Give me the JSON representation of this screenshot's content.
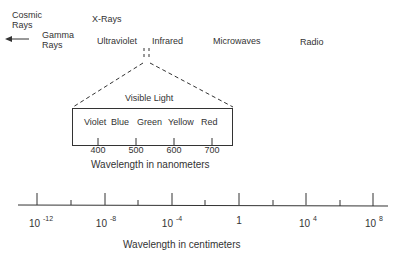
{
  "spectrum_labels": {
    "cosmic_rays_line1": "Cosmic",
    "cosmic_rays_line2": "Rays",
    "gamma_rays_line1": "Gamma",
    "gamma_rays_line2": "Rays",
    "x_rays": "X-Rays",
    "ultraviolet": "Ultraviolet",
    "infrared": "Infrared",
    "microwaves": "Microwaves",
    "radio": "Radio"
  },
  "visible_light": {
    "title": "Visible Light",
    "colors": [
      "Violet",
      "Blue",
      "Green",
      "Yellow",
      "Red"
    ],
    "ticks": [
      "400",
      "500",
      "600",
      "700"
    ],
    "axis_label": "Wavelength in nanometers"
  },
  "main_axis": {
    "ticks": [
      {
        "base": "10",
        "exp": "-12"
      },
      {
        "base": "10",
        "exp": "-8"
      },
      {
        "base": "10",
        "exp": "-4"
      },
      {
        "base": "1",
        "exp": ""
      },
      {
        "base": "10",
        "exp": "4"
      },
      {
        "base": "10",
        "exp": "8"
      }
    ],
    "axis_label": "Wavelength in centimeters"
  },
  "colors": {
    "ink": "#333333",
    "background": "#ffffff"
  }
}
